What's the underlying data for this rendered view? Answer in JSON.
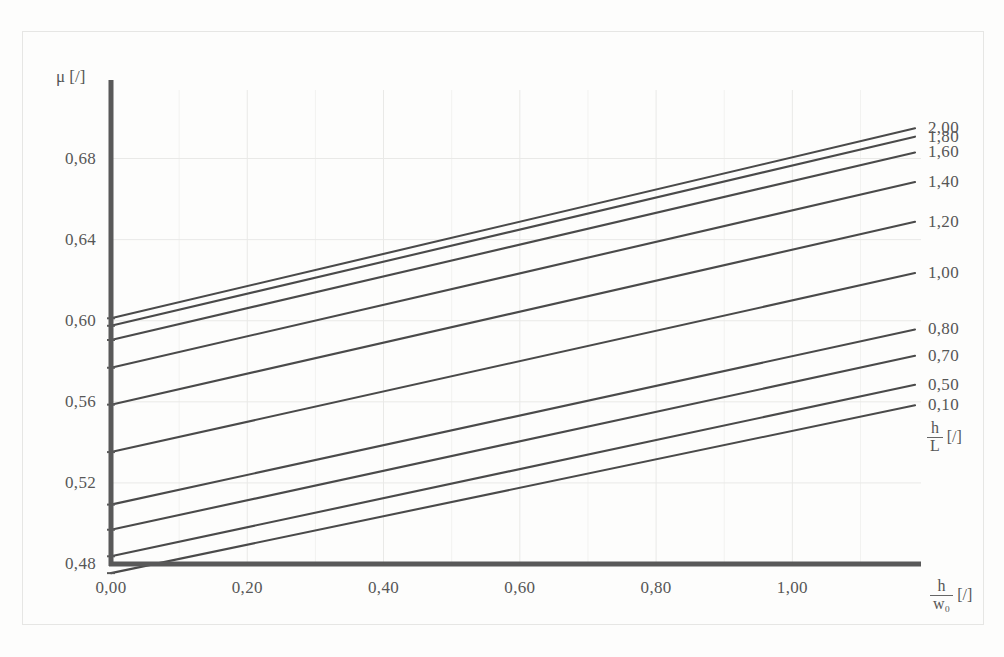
{
  "chart_data": {
    "type": "line",
    "title": "",
    "subtitle": "",
    "xlabel": "h / w_0 [/]",
    "ylabel": "mu [/]",
    "xlim": [
      0.0,
      1.18
    ],
    "ylim": [
      0.48,
      0.7
    ],
    "grid": true,
    "legend_position": "right",
    "legend_title": "h/L [/]",
    "x_ticks": [
      "0,00",
      "0,20",
      "0,40",
      "0,60",
      "0,80",
      "1,00"
    ],
    "x_tick_values": [
      0.0,
      0.2,
      0.4,
      0.6,
      0.8,
      1.0
    ],
    "y_ticks": [
      "0,48",
      "0,52",
      "0,56",
      "0,60",
      "0,64",
      "0,68"
    ],
    "y_tick_values": [
      0.48,
      0.52,
      0.56,
      0.6,
      0.64,
      0.68
    ],
    "x": [
      0.0,
      1.18
    ],
    "series": [
      {
        "name": "2,00",
        "values": [
          0.6012,
          0.6949
        ]
      },
      {
        "name": "1,80",
        "values": [
          0.5975,
          0.6908
        ]
      },
      {
        "name": "1,60",
        "values": [
          0.5905,
          0.683
        ]
      },
      {
        "name": "1,40",
        "values": [
          0.5768,
          0.6684
        ]
      },
      {
        "name": "1,20",
        "values": [
          0.5586,
          0.6488
        ]
      },
      {
        "name": "1,00",
        "values": [
          0.5352,
          0.6235
        ]
      },
      {
        "name": "0,80",
        "values": [
          0.5093,
          0.5957
        ]
      },
      {
        "name": "0,70",
        "values": [
          0.4969,
          0.5827
        ]
      },
      {
        "name": "0,50",
        "values": [
          0.4838,
          0.5684
        ]
      },
      {
        "name": "0,10",
        "values": [
          0.4755,
          0.5583
        ]
      }
    ]
  },
  "axes": {
    "y_title_text": "μ [/]",
    "x_title_num": "h",
    "x_title_den": "w₀",
    "x_title_unit": "[/]",
    "legend_title_num": "h",
    "legend_title_den": "L",
    "legend_title_unit": "[/]"
  },
  "style": {
    "line_color": "#4a4a4a",
    "axis_color": "#595959",
    "grid_color": "#e9e9e7",
    "text_color": "#565656",
    "background": "#fdfdfc"
  }
}
